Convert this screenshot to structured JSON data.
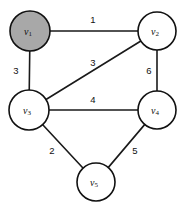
{
  "figure": {
    "background_color": "#ffffff"
  },
  "chart_data": {
    "type": "diagram",
    "diagram_type": "weighted-undirected-graph",
    "title": "",
    "xlabel": "",
    "ylabel": "",
    "grid": false,
    "legend": false,
    "node_radius": 19,
    "node_default_fill": "#ffffff",
    "node_highlight_fill": "#a8a8a8",
    "node_stroke": "#111111",
    "edge_color": "#1a1a1a",
    "nodes": [
      {
        "id": "v1",
        "label": "v",
        "sub": "1",
        "x": 30,
        "y": 31,
        "r": 20,
        "fill": "#a8a8a8",
        "highlighted": true
      },
      {
        "id": "v2",
        "label": "v",
        "sub": "2",
        "x": 157,
        "y": 31,
        "r": 19,
        "fill": "#ffffff",
        "highlighted": false
      },
      {
        "id": "v3",
        "label": "v",
        "sub": "3",
        "x": 29,
        "y": 110,
        "r": 20,
        "fill": "#ffffff",
        "highlighted": false
      },
      {
        "id": "v4",
        "label": "v",
        "sub": "4",
        "x": 157,
        "y": 110,
        "r": 19,
        "fill": "#ffffff",
        "highlighted": false
      },
      {
        "id": "v5",
        "label": "v",
        "sub": "5",
        "x": 96,
        "y": 182,
        "r": 19,
        "fill": "#ffffff",
        "highlighted": false
      }
    ],
    "edges": [
      {
        "id": "e-v1-v2",
        "source": "v1",
        "target": "v2",
        "weight": 1,
        "label": "1",
        "label_x": 93,
        "label_y": 19
      },
      {
        "id": "e-v1-v3",
        "source": "v1",
        "target": "v3",
        "weight": 3,
        "label": "3",
        "label_x": 16,
        "label_y": 70
      },
      {
        "id": "e-v3-v2",
        "source": "v3",
        "target": "v2",
        "weight": 3,
        "label": "3",
        "label_x": 93,
        "label_y": 62
      },
      {
        "id": "e-v2-v4",
        "source": "v2",
        "target": "v4",
        "weight": 6,
        "label": "6",
        "label_x": 149,
        "label_y": 70
      },
      {
        "id": "e-v3-v4",
        "source": "v3",
        "target": "v4",
        "weight": 4,
        "label": "4",
        "label_x": 93,
        "label_y": 99
      },
      {
        "id": "e-v3-v5",
        "source": "v3",
        "target": "v5",
        "weight": 2,
        "label": "2",
        "label_x": 52,
        "label_y": 150
      },
      {
        "id": "e-v4-v5",
        "source": "v4",
        "target": "v5",
        "weight": 5,
        "label": "5",
        "label_x": 135,
        "label_y": 150
      }
    ]
  }
}
